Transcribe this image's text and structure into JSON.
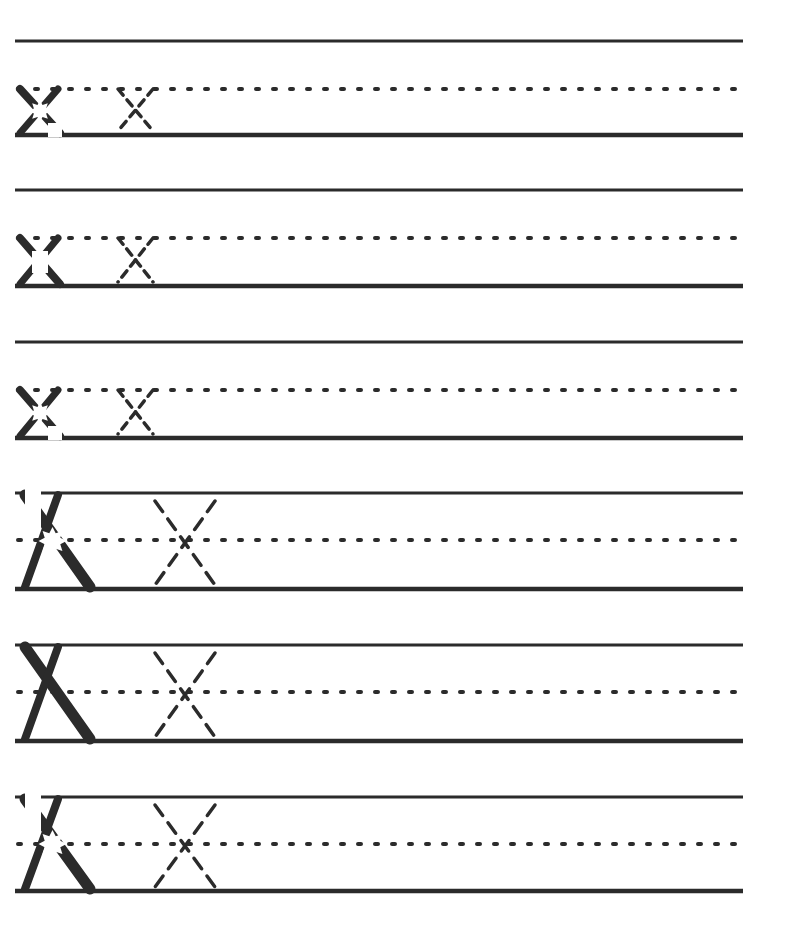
{
  "worksheet": {
    "title": "Letter X handwriting practice",
    "letter": "X",
    "colors": {
      "ink": "#2b2b2b",
      "guide": "#333333",
      "background": "#ffffff"
    },
    "small_rows": [
      {
        "top": 41,
        "mid": 89,
        "base": 135,
        "model": "partial-star"
      },
      {
        "top": 190,
        "mid": 238,
        "base": 286,
        "model": "partial-corners"
      },
      {
        "top": 342,
        "mid": 390,
        "base": 438,
        "model": "partial-star"
      }
    ],
    "large_rows": [
      {
        "top": 493,
        "mid": 540,
        "base": 589,
        "model": "partial-star"
      },
      {
        "top": 645,
        "mid": 692,
        "base": 741,
        "model": "solid"
      },
      {
        "top": 797,
        "mid": 844,
        "base": 891,
        "model": "partial-star"
      }
    ]
  }
}
